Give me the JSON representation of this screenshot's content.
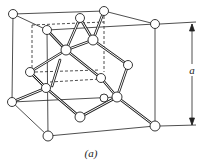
{
  "figure": {
    "caption": "(a)",
    "dimension_label": "a",
    "colors": {
      "line": "#222222",
      "atom_fill": "#ffffff",
      "background": "#ffffff"
    }
  },
  "atoms": [
    {
      "id": "tlb",
      "x": 13,
      "y": 14
    },
    {
      "id": "tlf",
      "x": 47,
      "y": 30
    },
    {
      "id": "tmb",
      "x": 80,
      "y": 18
    },
    {
      "id": "trb",
      "x": 104,
      "y": 11
    },
    {
      "id": "trf",
      "x": 155,
      "y": 24
    },
    {
      "id": "c1",
      "x": 66,
      "y": 50
    },
    {
      "id": "c2",
      "x": 93,
      "y": 40
    },
    {
      "id": "lm",
      "x": 30,
      "y": 72
    },
    {
      "id": "rf",
      "x": 128,
      "y": 65
    },
    {
      "id": "m1",
      "x": 101,
      "y": 78
    },
    {
      "id": "li",
      "x": 46,
      "y": 88
    },
    {
      "id": "ri",
      "x": 117,
      "y": 97
    },
    {
      "id": "mb",
      "x": 104,
      "y": 98
    },
    {
      "id": "blb",
      "x": 12,
      "y": 102
    },
    {
      "id": "bm",
      "x": 80,
      "y": 117
    },
    {
      "id": "blf",
      "x": 48,
      "y": 136
    },
    {
      "id": "brf",
      "x": 155,
      "y": 126
    }
  ]
}
